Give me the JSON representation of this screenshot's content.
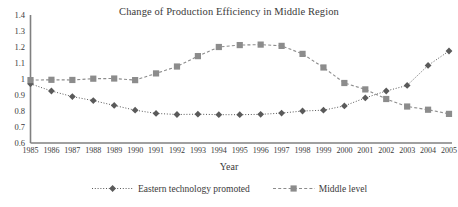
{
  "chart_data": {
    "type": "line",
    "title": "Change of Production Efficiency in Middle Region",
    "xlabel": "Year",
    "ylabel": "",
    "grid": false,
    "legend_position": "bottom",
    "ylim": [
      0.6,
      1.4
    ],
    "ytick_labels": [
      "1.4",
      "1.3",
      "1.2",
      "1.1",
      "1",
      "0.9",
      "0.8",
      "0.7",
      "0.6"
    ],
    "ytick_values": [
      1.4,
      1.3,
      1.2,
      1.1,
      1.0,
      0.9,
      0.8,
      0.7,
      0.6
    ],
    "categories": [
      "1985",
      "1986",
      "1987",
      "1988",
      "1989",
      "1990",
      "1991",
      "1992",
      "1993",
      "1994",
      "1995",
      "1996",
      "1997",
      "1998",
      "1999",
      "2000",
      "2001",
      "2002",
      "2003",
      "2004",
      "2005"
    ],
    "series": [
      {
        "name": "Eastern technology promoted",
        "marker": "diamond",
        "color": "#5a5a5a",
        "line_style": "dotted",
        "values": [
          0.97,
          0.925,
          0.89,
          0.865,
          0.835,
          0.805,
          0.785,
          0.778,
          0.78,
          0.777,
          0.777,
          0.779,
          0.787,
          0.8,
          0.805,
          0.832,
          0.882,
          0.925,
          0.96,
          1.085,
          1.175
        ]
      },
      {
        "name": "Middle level",
        "marker": "square",
        "color": "#8c8c8c",
        "line_style": "dashed",
        "values": [
          0.993,
          0.995,
          0.994,
          1.002,
          1.003,
          0.993,
          1.035,
          1.078,
          1.143,
          1.2,
          1.212,
          1.215,
          1.207,
          1.157,
          1.072,
          0.975,
          0.935,
          0.875,
          0.828,
          0.808,
          0.782
        ]
      }
    ]
  },
  "legend": {
    "items": [
      {
        "label": "Eastern technology promoted",
        "marker": "diamond-marker-icon",
        "color": "#5a5a5a"
      },
      {
        "label": "Middle level",
        "marker": "square-marker-icon",
        "color": "#8c8c8c"
      }
    ]
  },
  "axes": {
    "axis_color": "#808080"
  }
}
